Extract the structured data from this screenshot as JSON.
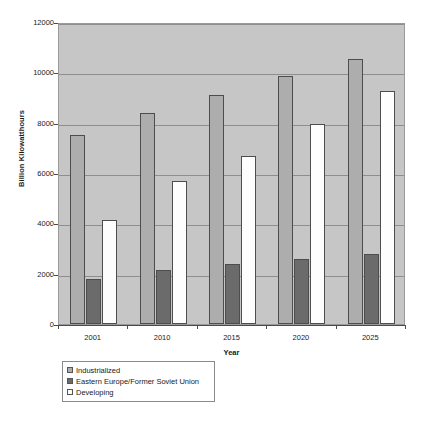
{
  "chart_data": {
    "type": "bar",
    "title": "",
    "xlabel": "Year",
    "ylabel": "Billion Kilowatthours",
    "categories": [
      "2001",
      "2010",
      "2015",
      "2020",
      "2025"
    ],
    "series": [
      {
        "name": "Industrialized",
        "color": "#adadad",
        "values": [
          7500,
          8380,
          9100,
          9850,
          10550
        ]
      },
      {
        "name": "Eastern Europe/Former Soviet Union",
        "color": "#6b6b6b",
        "values": [
          1800,
          2130,
          2380,
          2580,
          2800
        ]
      },
      {
        "name": "Developing",
        "color": "#ffffff",
        "values": [
          4130,
          5680,
          6680,
          7960,
          9250
        ]
      }
    ],
    "ylim": [
      0,
      12000
    ],
    "ytick_values": [
      0,
      2000,
      4000,
      6000,
      8000,
      10000,
      12000
    ],
    "ytick_labels": [
      "0",
      "2000",
      "4000",
      "6000",
      "8000",
      "10000",
      "12000"
    ],
    "grid": true,
    "legend_position": "below-left",
    "plot_background": "#c6c6c6"
  },
  "axes": {
    "y_title": "Billion Kilowatthours",
    "x_title": "Year"
  },
  "legend": {
    "items": [
      {
        "label": "Industrialized"
      },
      {
        "label": "Eastern Europe/Former Soviet Union"
      },
      {
        "label": "Developing"
      }
    ]
  }
}
